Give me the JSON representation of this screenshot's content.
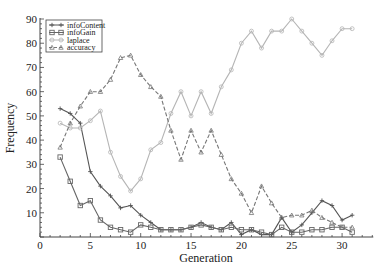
{
  "chart_data": {
    "type": "line",
    "title": "",
    "xlabel": "Generation",
    "ylabel": "Frequency",
    "xlim": [
      0,
      33
    ],
    "ylim": [
      0,
      90
    ],
    "xticks": [
      0,
      5,
      10,
      15,
      20,
      25,
      30
    ],
    "yticks": [
      10,
      20,
      30,
      40,
      50,
      60,
      70,
      80,
      90
    ],
    "grid": false,
    "legend_position": "upper left",
    "x": [
      2,
      3,
      4,
      5,
      6,
      7,
      8,
      9,
      10,
      11,
      12,
      13,
      14,
      15,
      16,
      17,
      18,
      19,
      20,
      21,
      22,
      23,
      24,
      25,
      26,
      27,
      28,
      29,
      30,
      31
    ],
    "series": [
      {
        "name": "infoContent",
        "marker": "plus",
        "style": "solid",
        "color": "#555555",
        "values": [
          53,
          51,
          47,
          27,
          21,
          17,
          12,
          13,
          9,
          6,
          3,
          3,
          3,
          4,
          6,
          4,
          3,
          6,
          1,
          3,
          1,
          1,
          8,
          2,
          5,
          10,
          15,
          13,
          7,
          9
        ]
      },
      {
        "name": "infoGain",
        "marker": "square",
        "style": "solid",
        "color": "#666666",
        "values": [
          33,
          23,
          13,
          15,
          7,
          4,
          3,
          2,
          5,
          4,
          3,
          3,
          3,
          4,
          5,
          4,
          3,
          4,
          3,
          3,
          2,
          1,
          4,
          2,
          2,
          3,
          3,
          4,
          4,
          2
        ]
      },
      {
        "name": "laplace",
        "marker": "circle",
        "style": "solid",
        "color": "#b5b5b5",
        "values": [
          47,
          45,
          45,
          48,
          52,
          35,
          25,
          19,
          24,
          36,
          39,
          51,
          60,
          50,
          60,
          51,
          62,
          69,
          80,
          85,
          78,
          85,
          85,
          90,
          85,
          80,
          75,
          81,
          86,
          86
        ]
      },
      {
        "name": "accuracy",
        "marker": "triangle",
        "style": "dashed",
        "color": "#777777",
        "values": [
          37,
          47,
          54,
          60,
          60,
          65,
          74,
          75,
          67,
          62,
          58,
          44,
          32,
          44,
          35,
          44,
          34,
          24,
          18,
          10,
          21,
          14,
          8,
          9,
          9,
          11,
          8,
          6,
          4,
          4
        ]
      }
    ]
  }
}
